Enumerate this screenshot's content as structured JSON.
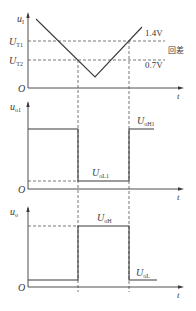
{
  "panels": {
    "input": {
      "y_label_main": "u",
      "y_label_sub": "I",
      "x_label": "t",
      "origin": "O",
      "threshold1_main": "U",
      "threshold1_sub": "T1",
      "threshold2_main": "U",
      "threshold2_sub": "T2",
      "threshold1_value": "1.4V",
      "threshold2_value": "0.7V",
      "hysteresis_label": "回差"
    },
    "output1": {
      "y_label_main": "u",
      "y_label_sub": "o1",
      "x_label": "t",
      "origin": "O",
      "high_main": "U",
      "high_sub": "oH1",
      "low_main": "U",
      "low_sub": "oL1"
    },
    "output": {
      "y_label_main": "u",
      "y_label_sub": "o",
      "x_label": "t",
      "origin": "O",
      "high_main": "U",
      "high_sub": "oH",
      "low_main": "U",
      "low_sub": "oL"
    }
  },
  "colors": {
    "line": "#3a3a3a",
    "dash": "#555555",
    "background": "#ffffff"
  }
}
